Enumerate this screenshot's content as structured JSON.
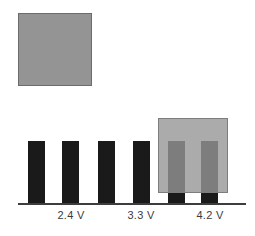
{
  "figure": {
    "background_color": "#ffffff",
    "legend_swatch": {
      "name": "gray-sample-swatch",
      "fill_color": "#949494",
      "border_color": "#6b6b6b",
      "label": ""
    },
    "overlay": {
      "name": "highlight-overlay",
      "fill_color": "#969696",
      "border_color": "#7d7d7d",
      "opacity": 0.8,
      "covers_bars": [
        5,
        6
      ]
    },
    "axis": {
      "color": "#3d3d3d",
      "show": true
    }
  },
  "chart_data": {
    "type": "bar",
    "title": "",
    "xlabel": "",
    "ylabel": "",
    "grid": false,
    "legend_position": "none",
    "bar_color": "#1a1a1a",
    "categories": [
      "1",
      "2",
      "3",
      "4",
      "5",
      "6"
    ],
    "values": [
      1,
      1,
      1,
      1,
      1,
      1
    ],
    "ylim": [
      0,
      1.15
    ],
    "tick_labels": [
      "2.4 V",
      "3.3 V",
      "4.2 V"
    ],
    "tick_label_positions": [
      1.5,
      3.5,
      5.5
    ],
    "annotations": [
      {
        "text": "2.4 V",
        "x": 1.5
      },
      {
        "text": "3.3 V",
        "x": 3.5
      },
      {
        "text": "4.2 V",
        "x": 5.5
      }
    ]
  }
}
